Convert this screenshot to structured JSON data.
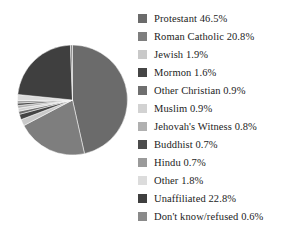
{
  "chart_data": {
    "type": "pie",
    "title": "",
    "subtitle": "",
    "xlabel": "",
    "ylabel": "",
    "legend_position": "right",
    "grid": false,
    "start_angle_clock": "12 o'clock",
    "direction": "clockwise",
    "units": "percent",
    "total": 100.0,
    "categories": [
      "Protestant",
      "Roman Catholic",
      "Jewish",
      "Mormon",
      "Other Christian",
      "Muslim",
      "Jehovah's Witness",
      "Buddhist",
      "Hindu",
      "Other",
      "Unaffiliated",
      "Don't know/refused"
    ],
    "values": [
      46.5,
      20.8,
      1.9,
      1.6,
      0.9,
      0.9,
      0.8,
      0.7,
      0.7,
      1.8,
      22.8,
      0.6
    ],
    "colors": [
      "#6b6b6b",
      "#7e7e7e",
      "#c9c9c9",
      "#454545",
      "#6f6f6f",
      "#d2d2d2",
      "#b0b0b0",
      "#4c4c4c",
      "#9a9a9a",
      "#dcdcdc",
      "#3f3f3f",
      "#8a8a8a"
    ],
    "slices": [
      {
        "label": "Protestant",
        "value": 46.5,
        "display": "Protestant 46.5%",
        "color": "#6b6b6b"
      },
      {
        "label": "Roman Catholic",
        "value": 20.8,
        "display": "Roman Catholic 20.8%",
        "color": "#7e7e7e"
      },
      {
        "label": "Jewish",
        "value": 1.9,
        "display": "Jewish 1.9%",
        "color": "#c9c9c9"
      },
      {
        "label": "Mormon",
        "value": 1.6,
        "display": "Mormon 1.6%",
        "color": "#454545"
      },
      {
        "label": "Other Christian",
        "value": 0.9,
        "display": "Other Christian 0.9%",
        "color": "#6f6f6f"
      },
      {
        "label": "Muslim",
        "value": 0.9,
        "display": "Muslim 0.9%",
        "color": "#d2d2d2"
      },
      {
        "label": "Jehovah's Witness",
        "value": 0.8,
        "display": "Jehovah's Witness 0.8%",
        "color": "#b0b0b0"
      },
      {
        "label": "Buddhist",
        "value": 0.7,
        "display": "Buddhist 0.7%",
        "color": "#4c4c4c"
      },
      {
        "label": "Hindu",
        "value": 0.7,
        "display": "Hindu 0.7%",
        "color": "#9a9a9a"
      },
      {
        "label": "Other",
        "value": 1.8,
        "display": "Other 1.8%",
        "color": "#dcdcdc"
      },
      {
        "label": "Unaffiliated",
        "value": 22.8,
        "display": "Unaffiliated 22.8%",
        "color": "#3f3f3f"
      },
      {
        "label": "Don't know/refused",
        "value": 0.6,
        "display": "Don't know/refused 0.6%",
        "color": "#8a8a8a"
      }
    ]
  },
  "legend": {
    "items": [
      {
        "text": "Protestant 46.5%",
        "color": "#6b6b6b"
      },
      {
        "text": "Roman Catholic 20.8%",
        "color": "#7e7e7e"
      },
      {
        "text": "Jewish 1.9%",
        "color": "#c9c9c9"
      },
      {
        "text": "Mormon 1.6%",
        "color": "#454545"
      },
      {
        "text": "Other Christian 0.9%",
        "color": "#6f6f6f"
      },
      {
        "text": "Muslim 0.9%",
        "color": "#d2d2d2"
      },
      {
        "text": "Jehovah's Witness 0.8%",
        "color": "#b0b0b0"
      },
      {
        "text": "Buddhist 0.7%",
        "color": "#4c4c4c"
      },
      {
        "text": "Hindu 0.7%",
        "color": "#9a9a9a"
      },
      {
        "text": "Other 1.8%",
        "color": "#dcdcdc"
      },
      {
        "text": "Unaffiliated 22.8%",
        "color": "#3f3f3f"
      },
      {
        "text": "Don't know/refused 0.6%",
        "color": "#8a8a8a"
      }
    ]
  },
  "caption": {
    "text": ""
  }
}
